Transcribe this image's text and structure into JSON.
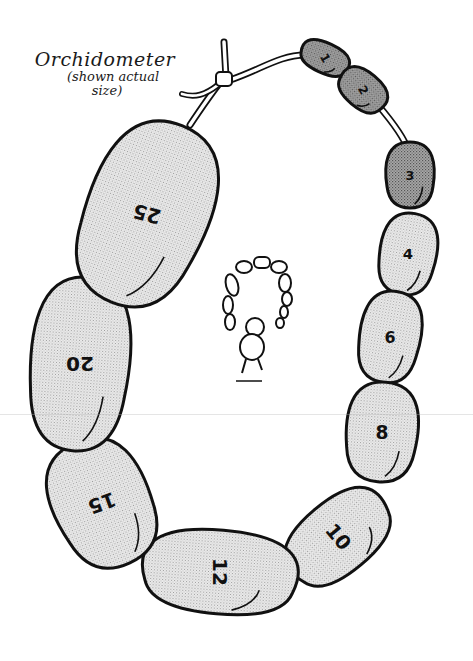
{
  "caption": {
    "title": "Orchidometer",
    "subtitle_line1": "(shown actual",
    "subtitle_line2": "size)"
  },
  "colors": {
    "outline": "#111111",
    "bead_light": "#e4e4e4",
    "bead_dark": "#9a9a9a",
    "cord": "#ffffff",
    "background": "#ffffff"
  },
  "beads": [
    {
      "label": "1",
      "cx": 325,
      "cy": 58,
      "rx": 24,
      "ry": 15,
      "rot": 25,
      "text_rot": 60,
      "shade": "dark"
    },
    {
      "label": "2",
      "cx": 363,
      "cy": 90,
      "rx": 25,
      "ry": 18,
      "rot": 40,
      "text_rot": 60,
      "shade": "dark"
    },
    {
      "label": "3",
      "cx": 410,
      "cy": 175,
      "rx": 23,
      "ry": 33,
      "rot": 0,
      "text_rot": 0,
      "shade": "dark"
    },
    {
      "label": "4",
      "cx": 408,
      "cy": 254,
      "rx": 27,
      "ry": 41,
      "rot": 10,
      "text_rot": 0,
      "shade": "light"
    },
    {
      "label": "6",
      "cx": 390,
      "cy": 337,
      "rx": 29,
      "ry": 46,
      "rot": 10,
      "text_rot": 0,
      "shade": "light"
    },
    {
      "label": "8",
      "cx": 382,
      "cy": 432,
      "rx": 34,
      "ry": 50,
      "rot": 5,
      "text_rot": 0,
      "shade": "light"
    },
    {
      "label": "10",
      "cx": 338,
      "cy": 537,
      "rx": 55,
      "ry": 36,
      "rot": -40,
      "text_rot": 50,
      "shade": "light"
    },
    {
      "label": "12",
      "cx": 220,
      "cy": 572,
      "rx": 74,
      "ry": 42,
      "rot": 5,
      "text_rot": 90,
      "shade": "light"
    },
    {
      "label": "15",
      "cx": 102,
      "cy": 503,
      "rx": 46,
      "ry": 66,
      "rot": -25,
      "text_rot": 160,
      "shade": "light"
    },
    {
      "label": "20",
      "cx": 80,
      "cy": 364,
      "rx": 47,
      "ry": 87,
      "rot": 5,
      "text_rot": 180,
      "shade": "light"
    },
    {
      "label": "25",
      "cx": 147,
      "cy": 214,
      "rx": 58,
      "ry": 95,
      "rot": 22,
      "text_rot": 195,
      "shade": "light"
    }
  ]
}
